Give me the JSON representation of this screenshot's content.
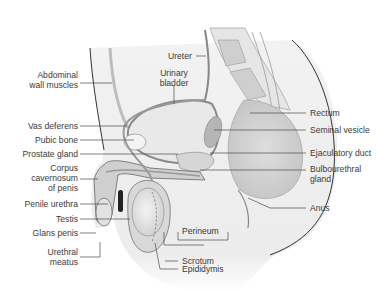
{
  "diagram": {
    "colors": {
      "background": "#ffffff",
      "tissue_light": "#ececec",
      "tissue_mid": "#d2d2d2",
      "tissue_dark": "#9a9a9a",
      "outline": "#333333",
      "label_text": "#3a3a3a",
      "leader_line": "#4a4a4a"
    },
    "labels": {
      "left": [
        {
          "id": "abdominal_wall_muscles",
          "text_l1": "Abdominal",
          "text_l2": "wall muscles"
        },
        {
          "id": "vas_deferens",
          "text": "Vas deferens"
        },
        {
          "id": "pubic_bone",
          "text": "Pubic bone"
        },
        {
          "id": "prostate_gland",
          "text": "Prostate gland"
        },
        {
          "id": "corpus_cavernosum",
          "text_l1": "Corpus",
          "text_l2": "cavernosum",
          "text_l3": "of penis"
        },
        {
          "id": "penile_urethra",
          "text": "Penile urethra"
        },
        {
          "id": "testis",
          "text": "Testis"
        },
        {
          "id": "glans_penis",
          "text": "Glans penis"
        },
        {
          "id": "urethral_meatus",
          "text_l1": "Urethral",
          "text_l2": "meatus"
        }
      ],
      "top": [
        {
          "id": "ureter",
          "text": "Ureter"
        },
        {
          "id": "urinary_bladder",
          "text_l1": "Urinary",
          "text_l2": "bladder"
        }
      ],
      "right": [
        {
          "id": "rectum",
          "text": "Rectum"
        },
        {
          "id": "seminal_vesicle",
          "text": "Seminal vesicle"
        },
        {
          "id": "ejaculatory_duct",
          "text": "Ejaculatory duct"
        },
        {
          "id": "bulbourethral_gland",
          "text_l1": "Bulbourethral",
          "text_l2": "gland"
        },
        {
          "id": "anus",
          "text": "Anus"
        }
      ],
      "bottom": [
        {
          "id": "perineum",
          "text": "Perineum"
        },
        {
          "id": "scrotum",
          "text": "Scrotum"
        },
        {
          "id": "epididymis",
          "text": "Epididymis"
        }
      ]
    }
  }
}
